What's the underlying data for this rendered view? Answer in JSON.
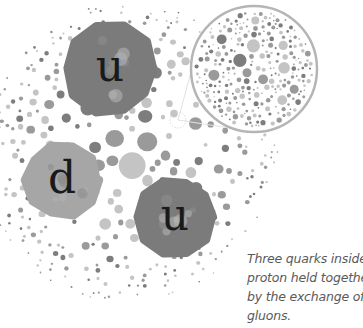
{
  "diagram": {
    "colors": {
      "background": "#ffffff",
      "quark_u": "#7b7b7b",
      "quark_d": "#a6a6a6",
      "gluon_dark": "#7d7d7d",
      "gluon_mid": "#9a9a9a",
      "gluon_light": "#c4c4c4",
      "magnifier_ring": "#b5b5b5",
      "label": "#1a1a1a",
      "caption": "#5a5a5a"
    },
    "proton": {
      "cx": 128,
      "cy": 152,
      "r": 150
    },
    "magnifier": {
      "cx": 254,
      "cy": 69,
      "r": 63,
      "source_cx": 178,
      "source_cy": 120
    },
    "quarks": [
      {
        "label": "u",
        "flavor": "up",
        "cx": 110,
        "cy": 68,
        "r": 45
      },
      {
        "label": "d",
        "flavor": "down",
        "cx": 62,
        "cy": 180,
        "r": 36
      },
      {
        "label": "u",
        "flavor": "up",
        "cx": 175,
        "cy": 217,
        "r": 38
      }
    ]
  },
  "caption": {
    "lines": [
      "Three quarks inside a",
      "proton held together",
      "by the exchange of",
      "gluons."
    ]
  }
}
